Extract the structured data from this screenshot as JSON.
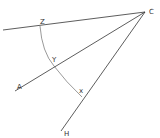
{
  "diagram": {
    "type": "geometric-angle-construction",
    "vertex": {
      "label": "C",
      "x": 145,
      "y": 12
    },
    "rays": [
      {
        "name": "ray-cz",
        "end": {
          "x": 3,
          "y": 30
        }
      },
      {
        "name": "ray-ca",
        "end": {
          "x": 15,
          "y": 91
        },
        "end_label": "A"
      },
      {
        "name": "ray-ch",
        "end": {
          "x": 61,
          "y": 131
        },
        "end_label": "H"
      }
    ],
    "arc": {
      "center": "C",
      "from": "Z",
      "to": "X",
      "through": "Y"
    },
    "points": [
      {
        "label": "Z",
        "x": 40,
        "y": 25
      },
      {
        "label": "Y",
        "x": 53,
        "y": 64
      },
      {
        "label": "X",
        "x": 82,
        "y": 95
      }
    ],
    "labels": {
      "C": "C",
      "Z": "Z",
      "Y": "Y",
      "X": "x",
      "A": "A",
      "H": "H"
    },
    "stroke_color": "#333333"
  }
}
